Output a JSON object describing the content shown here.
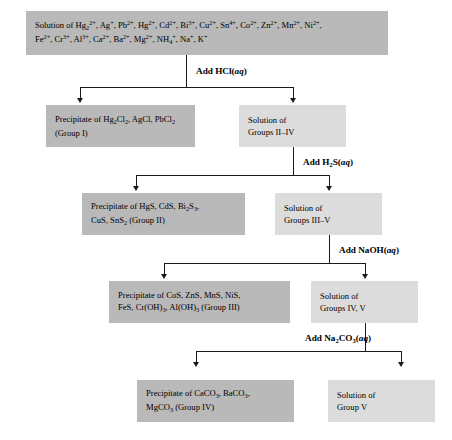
{
  "diagram": {
    "colors": {
      "precipitate_box": "#b9b9b9",
      "solution_box": "#dcdcdc",
      "arrow": "#1a1a1a",
      "background": "#ffffff"
    }
  },
  "source": {
    "label_plain": "Solution of Hg2 2+, Ag+, Pb2+, Hg2+, Cd2+, Bi3+, Cu2+, Sn4+, Co2+, Zn2+, Mn2+, Ni2+, Fe2+, Cr3+, Al3+, Ca2+, Ba2+, Mg2+, NH4+, Na+, K+",
    "line1_prefix": "Solution of ",
    "ions_line1": [
      "Hg2^2+",
      "Ag^+",
      "Pb^2+",
      "Hg^2+",
      "Cd^2+",
      "Bi^3+",
      "Cu^2+",
      "Sn^4+",
      "Co^2+",
      "Zn^2+",
      "Mn^2+",
      "Ni^2+"
    ],
    "ions_line2": [
      "Fe^2+",
      "Cr^3+",
      "Al^3+",
      "Ca^2+",
      "Ba^2+",
      "Mg^2+",
      "NH4^+",
      "Na^+",
      "K^+"
    ]
  },
  "steps": [
    {
      "reagent": "Add HCl(aq)",
      "reagent_formula": "HCl",
      "reagent_state": "aq",
      "precipitate": {
        "line1": "Precipitate of Hg2Cl2, AgCl, PbCl2",
        "line2": "(Group I)",
        "group": "Group I",
        "species": [
          "Hg2Cl2",
          "AgCl",
          "PbCl2"
        ]
      },
      "solution": {
        "line1": "Solution of",
        "line2": "Groups II–IV",
        "groups": "Groups II–IV"
      }
    },
    {
      "reagent": "Add H2S(aq)",
      "reagent_formula": "H2S",
      "reagent_state": "aq",
      "precipitate": {
        "line1": "Precipitate of HgS, CdS, Bi2S3,",
        "line2": "CuS, SnS2 (Group II)",
        "group": "Group II",
        "species": [
          "HgS",
          "CdS",
          "Bi2S3",
          "CuS",
          "SnS2"
        ]
      },
      "solution": {
        "line1": "Solution of",
        "line2": "Groups III–V",
        "groups": "Groups III–V"
      }
    },
    {
      "reagent": "Add NaOH(aq)",
      "reagent_formula": "NaOH",
      "reagent_state": "aq",
      "precipitate": {
        "line1": "Precipitate of CoS, ZnS, MnS, NiS,",
        "line2": "FeS, Cr(OH)3, Al(OH)3 (Group III)",
        "group": "Group III",
        "species": [
          "CoS",
          "ZnS",
          "MnS",
          "NiS",
          "FeS",
          "Cr(OH)3",
          "Al(OH)3"
        ]
      },
      "solution": {
        "line1": "Solution of",
        "line2": "Groups IV, V",
        "groups": "Groups IV, V"
      }
    },
    {
      "reagent": "Add Na2CO3(aq)",
      "reagent_formula": "Na2CO3",
      "reagent_state": "aq",
      "precipitate": {
        "line1": "Precipitate of CaCO3, BaCO3,",
        "line2": "MgCO3 (Group IV)",
        "group": "Group IV",
        "species": [
          "CaCO3",
          "BaCO3",
          "MgCO3"
        ]
      },
      "solution": {
        "line1": "Solution of",
        "line2": "Group V",
        "groups": "Group V"
      }
    }
  ]
}
